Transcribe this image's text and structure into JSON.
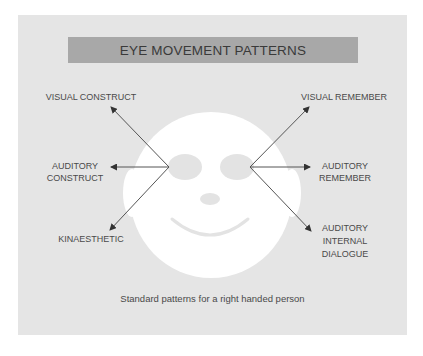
{
  "diagram": {
    "title": "EYE MOVEMENT PATTERNS",
    "caption": "Standard patterns for a right handed person",
    "labels": {
      "visual_construct": "VISUAL CONSTRUCT",
      "auditory_construct_line1": "AUDITORY",
      "auditory_construct_line2": "CONSTRUCT",
      "kinaesthetic": "KINAESTHETIC",
      "visual_remember": "VISUAL REMEMBER",
      "auditory_remember_line1": "AUDITORY",
      "auditory_remember_line2": "REMEMBER",
      "auditory_internal_line1": "AUDITORY",
      "auditory_internal_line2": "INTERNAL",
      "auditory_internal_line3": "DIALOGUE"
    },
    "colors": {
      "panel_background": "#e5e5e5",
      "title_banner": "#a8a8a8",
      "face": "#ffffff",
      "face_features": "#e3e3e3",
      "text": "#4a4a4a",
      "arrows": "#555555"
    }
  }
}
